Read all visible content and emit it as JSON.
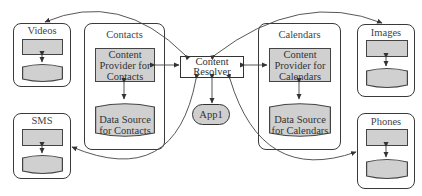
{
  "diagram": {
    "center": {
      "resolver_line1": "Content",
      "resolver_line2": "Resolver",
      "app_label": "App1"
    },
    "groups": {
      "videos": {
        "title": "Videos"
      },
      "sms": {
        "title": "SMS"
      },
      "images": {
        "title": "Images"
      },
      "phones": {
        "title": "Phones"
      },
      "contacts": {
        "title": "Contacts",
        "provider_line1": "Content",
        "provider_line2": "Provider for",
        "provider_line3": "Contacts",
        "source_line1": "Data Source",
        "source_line2": "for Contacts"
      },
      "calendars": {
        "title": "Calendars",
        "provider_line1": "Content",
        "provider_line2": "Provider for",
        "provider_line3": "Calendars",
        "source_line1": "Data Source",
        "source_line2": "for Calendars"
      }
    },
    "colors": {
      "box_fill": "#d0d0d0",
      "stroke": "#3a3a3a",
      "background": "#ffffff"
    }
  }
}
